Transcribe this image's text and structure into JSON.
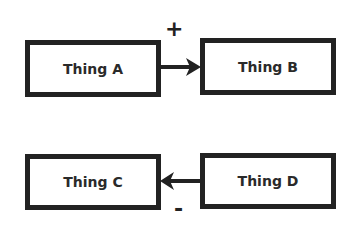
{
  "diagram": {
    "nodes": [
      {
        "id": "A",
        "label": "Thing A"
      },
      {
        "id": "B",
        "label": "Thing B"
      },
      {
        "id": "C",
        "label": "Thing C"
      },
      {
        "id": "D",
        "label": "Thing D"
      }
    ],
    "edges": [
      {
        "from": "A",
        "to": "B",
        "sign": "+"
      },
      {
        "from": "D",
        "to": "C",
        "sign": "-"
      }
    ],
    "colors": {
      "stroke": "#222222",
      "background": "#ffffff"
    }
  }
}
